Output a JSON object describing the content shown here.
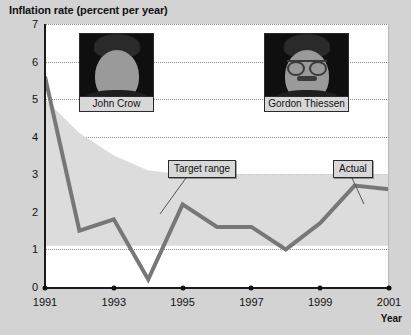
{
  "chart_data": {
    "type": "line",
    "title": "Inflation rate (percent per year)",
    "xlabel": "Year",
    "ylabel": "Inflation rate (percent per year)",
    "xlim": [
      1991,
      2001
    ],
    "ylim": [
      0,
      7
    ],
    "grid": true,
    "legend_position": "inline-callouts",
    "x": [
      1991,
      1992,
      1993,
      1994,
      1995,
      1996,
      1997,
      1998,
      1999,
      2000,
      2001
    ],
    "xtick_labels": [
      "1991",
      "1993",
      "1995",
      "1997",
      "1999",
      "2001"
    ],
    "xtick_values": [
      1991,
      1993,
      1995,
      1997,
      1999,
      2001
    ],
    "ytick_labels": [
      "0",
      "1",
      "2",
      "3",
      "4",
      "5",
      "6",
      "7"
    ],
    "ytick_values": [
      0,
      1,
      2,
      3,
      4,
      5,
      6,
      7
    ],
    "series": [
      {
        "name": "Actual",
        "color": "#777777",
        "values": [
          5.6,
          1.5,
          1.8,
          0.2,
          2.2,
          1.6,
          1.6,
          1.0,
          1.7,
          2.7,
          2.6
        ]
      }
    ],
    "bands": [
      {
        "name": "Target range",
        "color": "#dcdcdc",
        "upper": [
          5.0,
          4.1,
          3.5,
          3.1,
          3.0,
          3.0,
          3.0,
          3.0,
          3.0,
          3.0,
          3.0
        ],
        "lower": [
          1.1,
          1.1,
          1.1,
          1.1,
          1.1,
          1.1,
          1.1,
          1.1,
          1.1,
          1.1,
          1.1
        ]
      }
    ],
    "annotations": [
      {
        "name": "Target range",
        "label": "Target range"
      },
      {
        "name": "Actual",
        "label": "Actual"
      }
    ]
  },
  "portraits": [
    {
      "name": "john-crow",
      "caption": "John Crow"
    },
    {
      "name": "gordon-thiessen",
      "caption": "Gordon Thiessen"
    }
  ],
  "colors": {
    "background": "#d3d3d3",
    "plot_background": "#ffffff",
    "line": "#777777",
    "band": "#dcdcdc",
    "axis": "#111111",
    "grid": "#8d8d8d"
  }
}
